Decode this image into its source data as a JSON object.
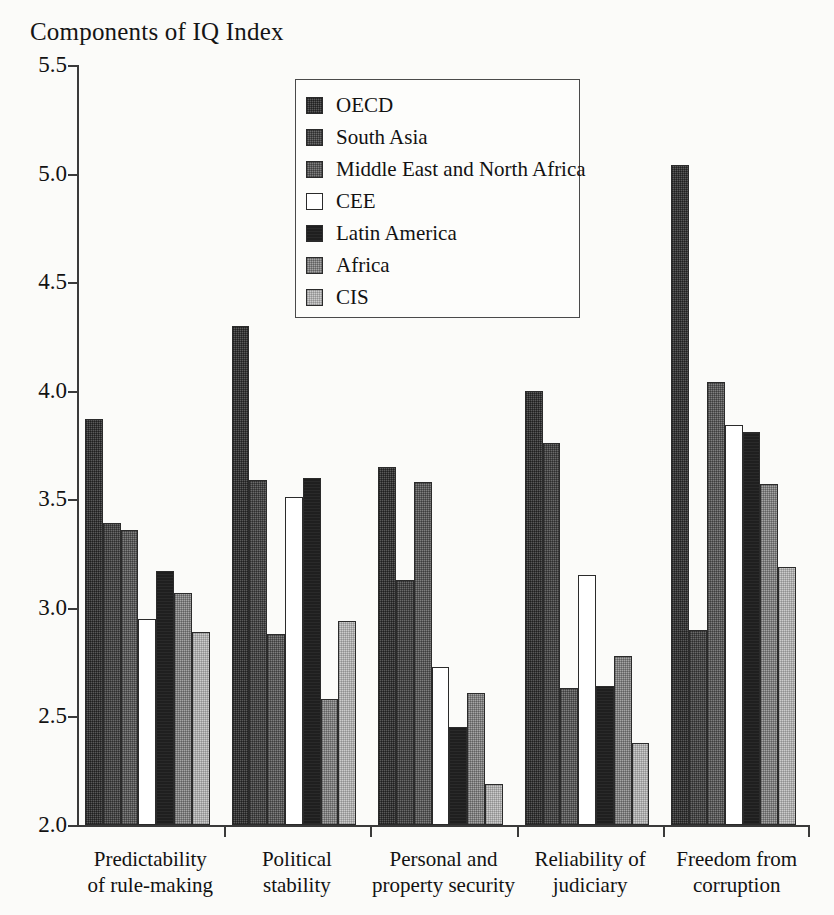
{
  "chart_data": {
    "type": "bar",
    "title": "Components of IQ Index",
    "xlabel": "",
    "ylabel": "",
    "ylim": [
      2.0,
      5.5
    ],
    "ytick_labels": [
      "5.5",
      "5.0",
      "4.5",
      "4.0",
      "3.5",
      "3.0",
      "2.5",
      "2.0"
    ],
    "ytick_values": [
      5.5,
      5.0,
      4.5,
      4.0,
      3.5,
      3.0,
      2.5,
      2.0
    ],
    "grid": false,
    "legend_position": "top-center-inside",
    "categories": [
      "Predictability of rule-making",
      "Political stability",
      "Personal and property security",
      "Reliability of judiciary",
      "Freedom from corruption"
    ],
    "category_lines": [
      [
        "Predictability",
        "of rule-making"
      ],
      [
        "Political",
        "stability"
      ],
      [
        "Personal and",
        "property security"
      ],
      [
        "Reliability of",
        "judiciary"
      ],
      [
        "Freedom from",
        "corruption"
      ]
    ],
    "series": [
      {
        "name": "OECD",
        "key": "oecd",
        "color": "#5a5a5a",
        "values": [
          3.87,
          4.3,
          3.65,
          4.0,
          5.04
        ]
      },
      {
        "name": "South Asia",
        "key": "south-asia",
        "color": "#6a6a6a",
        "values": [
          3.39,
          3.59,
          3.13,
          3.76,
          2.9
        ]
      },
      {
        "name": "Middle East and North Africa",
        "key": "mena",
        "color": "#808080",
        "values": [
          3.36,
          2.88,
          3.58,
          2.63,
          4.04
        ]
      },
      {
        "name": "CEE",
        "key": "cee",
        "color": "#ffffff",
        "values": [
          2.95,
          3.51,
          2.73,
          3.15,
          3.84
        ]
      },
      {
        "name": "Latin America",
        "key": "latin-america",
        "color": "#1f1f1f",
        "values": [
          3.17,
          3.6,
          2.45,
          2.64,
          3.81
        ]
      },
      {
        "name": "Africa",
        "key": "africa",
        "color": "#a5a5a5",
        "values": [
          3.07,
          2.58,
          2.61,
          2.78,
          3.57
        ]
      },
      {
        "name": "CIS",
        "key": "cis",
        "color": "#cccccc",
        "values": [
          2.89,
          2.94,
          2.19,
          2.38,
          3.19
        ]
      }
    ]
  },
  "legend": {
    "items": [
      {
        "label": "OECD",
        "swatch": "oecd"
      },
      {
        "label": "South Asia",
        "swatch": "south-asia"
      },
      {
        "label": "Middle East and North Africa",
        "swatch": "mena"
      },
      {
        "label": "CEE",
        "swatch": "cee"
      },
      {
        "label": "Latin America",
        "swatch": "latin-america"
      },
      {
        "label": "Africa",
        "swatch": "africa"
      },
      {
        "label": "CIS",
        "swatch": "cis"
      }
    ]
  }
}
